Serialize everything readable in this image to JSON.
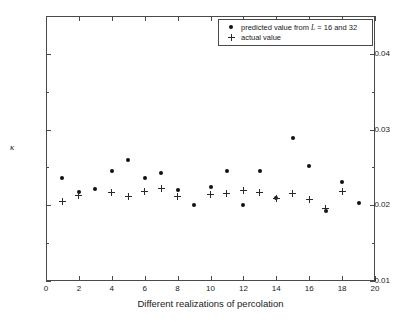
{
  "figure": {
    "caption_partial": "",
    "y_axis_label": "κ",
    "x_axis_label": "Different realizations of percolation"
  },
  "legend": {
    "position": "top-right-inside",
    "entries": [
      {
        "marker": "filled-dot",
        "label_prefix": "predicted value from ",
        "label_italic": "L",
        "label_suffix": " = 16 and 32"
      },
      {
        "marker": "plus",
        "label_prefix": "actual value",
        "label_italic": "",
        "label_suffix": ""
      }
    ]
  },
  "chart_data": {
    "type": "scatter",
    "title": "",
    "subtitle": "",
    "xlabel": "Different realizations of percolation",
    "ylabel": "κ",
    "xlim": [
      0,
      20
    ],
    "ylim": [
      0.01,
      0.045
    ],
    "xticks": [
      0,
      2,
      4,
      6,
      8,
      10,
      12,
      14,
      16,
      18,
      20
    ],
    "xticklabels": [
      "0",
      "2",
      "4",
      "6",
      "8",
      "10",
      "12",
      "14",
      "16",
      "18",
      "20"
    ],
    "yticks": [
      0.01,
      0.02,
      0.03,
      0.04
    ],
    "yticklabels": [
      "0.01",
      "0.02",
      "0.03",
      "0.04"
    ],
    "yticks_minor": [
      0.015,
      0.025,
      0.035
    ],
    "grid": false,
    "legend_position": "upper right",
    "x": [
      1,
      2,
      3,
      4,
      5,
      6,
      7,
      8,
      9,
      10,
      11,
      12,
      13,
      14,
      15,
      16,
      17,
      18,
      19
    ],
    "series": [
      {
        "name": "predicted value from L = 16 and 32",
        "marker": "filled-dot",
        "color": "#111111",
        "values": [
          0.0236,
          0.0218,
          0.0221,
          0.0245,
          0.026,
          0.0236,
          0.0243,
          0.022,
          0.02,
          0.0224,
          0.0245,
          0.02,
          0.0245,
          0.021,
          0.0289,
          0.0252,
          0.0192,
          0.0231,
          0.0203
        ]
      },
      {
        "name": "actual value",
        "marker": "plus",
        "color": "#2a2a2a",
        "values": [
          0.0205,
          0.0213,
          null,
          0.0217,
          0.0211,
          0.0218,
          0.0222,
          0.0212,
          null,
          0.0214,
          0.0215,
          0.022,
          0.0217,
          0.0209,
          0.0216,
          0.0208,
          0.0196,
          0.0218,
          null
        ]
      }
    ]
  }
}
